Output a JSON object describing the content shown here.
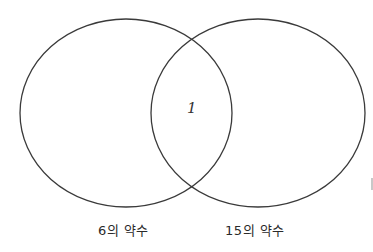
{
  "diagram": {
    "type": "venn",
    "sets": [
      {
        "id": "A",
        "label": "6의 약수",
        "only_elements": []
      },
      {
        "id": "B",
        "label": "15의 약수",
        "only_elements": []
      }
    ],
    "intersection": {
      "elements": [
        "1"
      ],
      "display": "1"
    },
    "colors": {
      "stroke": "#3a3a3a",
      "background": "#ffffff",
      "text": "#2a2a2a"
    }
  }
}
